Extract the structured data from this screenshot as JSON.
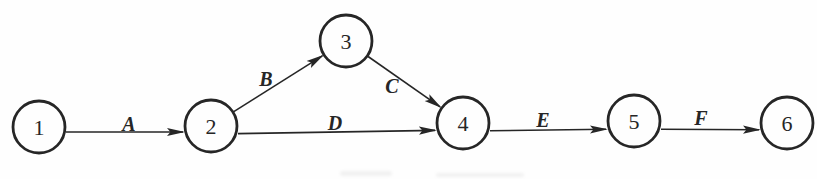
{
  "figure": {
    "width": 817,
    "height": 179,
    "background_color": "#fefefe",
    "ink_color": "#262626"
  },
  "diagram": {
    "node_radius": 26,
    "node_stroke_width": 2.8,
    "edge_stroke_width": 1.6,
    "nodes": [
      {
        "id": "1",
        "label": "1",
        "x": 39,
        "y": 127
      },
      {
        "id": "2",
        "label": "2",
        "x": 211,
        "y": 126
      },
      {
        "id": "3",
        "label": "3",
        "x": 346,
        "y": 41
      },
      {
        "id": "4",
        "label": "4",
        "x": 463,
        "y": 123
      },
      {
        "id": "5",
        "label": "5",
        "x": 634,
        "y": 121
      },
      {
        "id": "6",
        "label": "6",
        "x": 787,
        "y": 123
      }
    ],
    "edges": [
      {
        "label": "A",
        "from": "1",
        "to": "2",
        "dy_from": 5,
        "dy_to": 6,
        "label_x": 129,
        "label_y": 124
      },
      {
        "label": "B",
        "from": "2",
        "to": "3",
        "dy_from": 0,
        "dy_to": 0,
        "label_x": 266,
        "label_y": 79
      },
      {
        "label": "C",
        "from": "3",
        "to": "4",
        "dy_from": 0,
        "dy_to": 0,
        "label_x": 392,
        "label_y": 86
      },
      {
        "label": "D",
        "from": "2",
        "to": "4",
        "dy_from": 8,
        "dy_to": 7,
        "label_x": 335,
        "label_y": 123
      },
      {
        "label": "E",
        "from": "4",
        "to": "5",
        "dy_from": 8,
        "dy_to": 8,
        "label_x": 543,
        "label_y": 120
      },
      {
        "label": "F",
        "from": "5",
        "to": "6",
        "dy_from": 8,
        "dy_to": 7,
        "label_x": 701,
        "label_y": 118
      }
    ]
  }
}
